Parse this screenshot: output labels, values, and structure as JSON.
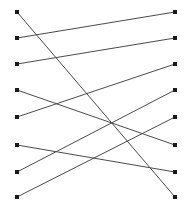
{
  "figure": {
    "title": "",
    "type": "bipartite-line-diagram",
    "background_color": "#ffffff",
    "width": 192,
    "height": 205
  },
  "style": {
    "edge_color": "#4a4a4a",
    "edge_width": 1,
    "node_color": "#1a1a1a",
    "node_size": 3.2
  },
  "chart_data": {
    "type": "scatter",
    "title": "",
    "xlabel": "",
    "ylabel": "",
    "grid": false,
    "legend": null,
    "xlim": [
      0,
      192
    ],
    "ylim": [
      0,
      205
    ],
    "left_column_x": 17,
    "right_column_x": 175,
    "node_rows_y": [
      12,
      38,
      64,
      90,
      117,
      145,
      172,
      197
    ],
    "left_nodes": [
      {
        "id": "L1",
        "x": 17,
        "y": 12
      },
      {
        "id": "L2",
        "x": 17,
        "y": 38
      },
      {
        "id": "L3",
        "x": 17,
        "y": 64
      },
      {
        "id": "L4",
        "x": 17,
        "y": 90
      },
      {
        "id": "L5",
        "x": 17,
        "y": 117
      },
      {
        "id": "L6",
        "x": 17,
        "y": 145
      },
      {
        "id": "L7",
        "x": 17,
        "y": 172
      },
      {
        "id": "L8",
        "x": 17,
        "y": 197
      }
    ],
    "right_nodes": [
      {
        "id": "R1",
        "x": 175,
        "y": 12
      },
      {
        "id": "R2",
        "x": 175,
        "y": 38
      },
      {
        "id": "R3",
        "x": 175,
        "y": 64
      },
      {
        "id": "R4",
        "x": 175,
        "y": 90
      },
      {
        "id": "R5",
        "x": 175,
        "y": 117
      },
      {
        "id": "R6",
        "x": 175,
        "y": 145
      },
      {
        "id": "R7",
        "x": 175,
        "y": 172
      },
      {
        "id": "R8",
        "x": 175,
        "y": 197
      }
    ],
    "edges": [
      {
        "id": "E1",
        "from": "L1",
        "to": "R8",
        "x1": 17,
        "y1": 12,
        "x2": 175,
        "y2": 197
      },
      {
        "id": "E2",
        "from": "L2",
        "to": "R1",
        "x1": 17,
        "y1": 38,
        "x2": 175,
        "y2": 12
      },
      {
        "id": "E3",
        "from": "L3",
        "to": "R2",
        "x1": 17,
        "y1": 64,
        "x2": 175,
        "y2": 38
      },
      {
        "id": "E4",
        "from": "L4",
        "to": "R6",
        "x1": 17,
        "y1": 90,
        "x2": 175,
        "y2": 145
      },
      {
        "id": "E5",
        "from": "L5",
        "to": "R3",
        "x1": 17,
        "y1": 117,
        "x2": 175,
        "y2": 64
      },
      {
        "id": "E6",
        "from": "L6",
        "to": "R7",
        "x1": 17,
        "y1": 145,
        "x2": 175,
        "y2": 172
      },
      {
        "id": "E7",
        "from": "L7",
        "to": "R4",
        "x1": 17,
        "y1": 172,
        "x2": 175,
        "y2": 90
      },
      {
        "id": "E8",
        "from": "L8",
        "to": "R5",
        "x1": 17,
        "y1": 197,
        "x2": 175,
        "y2": 117
      }
    ]
  }
}
